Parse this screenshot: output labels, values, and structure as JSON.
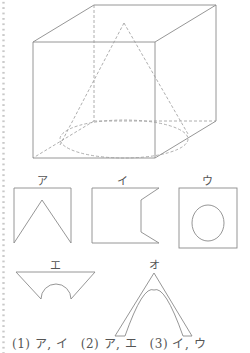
{
  "figure": {
    "solid": "cube containing a cone (dashed hidden lines)"
  },
  "choices": [
    {
      "key": "ア",
      "shape": "square with V notch from bottom"
    },
    {
      "key": "イ",
      "shape": "rectangle with notched right side"
    },
    {
      "key": "ウ",
      "shape": "square with circle inside"
    },
    {
      "key": "エ",
      "shape": "inverted trapezoid with semicircle cut"
    },
    {
      "key": "オ",
      "shape": "triangle with curved inner arch"
    }
  ],
  "labels": {
    "a": "ア",
    "i": "イ",
    "u": "ウ",
    "e": "エ",
    "o": "オ"
  },
  "answers": [
    {
      "text": "(1) ア, イ"
    },
    {
      "text": "(2) ア, エ"
    },
    {
      "text": "(3) イ, ウ"
    }
  ]
}
